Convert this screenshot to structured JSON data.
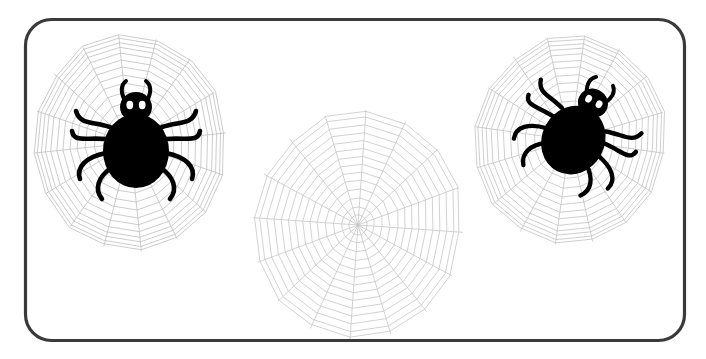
{
  "artwork": {
    "title": "Spiders and spider webs illustration",
    "kind": "clipart-illustration",
    "canvas": {
      "width": 706,
      "height": 359,
      "background": "#ffffff"
    }
  },
  "frame": {
    "name": "rounded-rectangle-border",
    "x": 25.5,
    "y": 19.5,
    "width": 659,
    "height": 321,
    "radius": 26,
    "stroke_color": "#3a3a3c",
    "stroke_width": 3.2,
    "fill": "#ffffff"
  },
  "palette": {
    "spider_body": "#000000",
    "spider_eye": "#ffffff",
    "web_line": "#c2c2c2",
    "web_line_strong": "#9a9a9a",
    "border": "#3a3a3c",
    "background": "#ffffff"
  },
  "webs": [
    {
      "name": "web-left",
      "cx": 130,
      "cy": 143,
      "radius_x": 96,
      "radius_y": 108,
      "spokes": 16,
      "rings": 13,
      "rotation_deg": -6,
      "stroke_color": "#c2c2c2",
      "stroke_width": 0.8
    },
    {
      "name": "web-center",
      "cx": 358,
      "cy": 225,
      "radius_x": 105,
      "radius_y": 115,
      "spokes": 16,
      "rings": 14,
      "rotation_deg": 4,
      "stroke_color": "#c8c8c8",
      "stroke_width": 0.8
    },
    {
      "name": "web-right",
      "cx": 570,
      "cy": 140,
      "radius_x": 95,
      "radius_y": 105,
      "spokes": 16,
      "rings": 13,
      "rotation_deg": 8,
      "stroke_color": "#c6c6c6",
      "stroke_width": 0.8
    }
  ],
  "spiders": [
    {
      "name": "spider-left",
      "cx": 136,
      "cy": 145,
      "scale": 1.0,
      "rotation_deg": 0,
      "body_rx": 32,
      "body_ry": 36,
      "head_rx": 15,
      "head_ry": 14,
      "leg_count": 8,
      "eyes": 2,
      "antennae": 2
    },
    {
      "name": "spider-right",
      "cx": 576,
      "cy": 135,
      "scale": 0.95,
      "rotation_deg": 28,
      "body_rx": 32,
      "body_ry": 36,
      "head_rx": 15,
      "head_ry": 14,
      "leg_count": 8,
      "eyes": 2,
      "antennae": 2
    }
  ],
  "counts": {
    "spiders": 2,
    "webs": 3
  }
}
